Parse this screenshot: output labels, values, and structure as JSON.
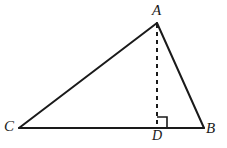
{
  "figure": {
    "name": "triangle-with-altitude",
    "background_color": "#ffffff",
    "stroke_color": "#1a1a1a",
    "label_color": "#1a1a1a",
    "canvas": {
      "width": 227,
      "height": 148
    },
    "labels": {
      "apex": "A",
      "right_base": "B",
      "left_base": "C",
      "foot_of_altitude": "D"
    },
    "points": {
      "A": {
        "x": 157,
        "y": 23
      },
      "B": {
        "x": 204,
        "y": 128
      },
      "C": {
        "x": 19,
        "y": 128
      },
      "D": {
        "x": 157,
        "y": 128
      }
    },
    "segments": [
      {
        "name": "side-CA",
        "from": "C",
        "to": "A",
        "style": "solid",
        "width": 2
      },
      {
        "name": "side-AB",
        "from": "A",
        "to": "B",
        "style": "solid",
        "width": 2
      },
      {
        "name": "side-CB",
        "from": "C",
        "to": "B",
        "style": "solid",
        "width": 2
      },
      {
        "name": "altitude-AD",
        "from": "A",
        "to": "D",
        "style": "dashed",
        "width": 2
      }
    ],
    "right_angle_marker": {
      "at": "D",
      "size": 10,
      "orientation": "upper-right",
      "stroke_width": 1.6
    },
    "dash_pattern": "4 4"
  }
}
